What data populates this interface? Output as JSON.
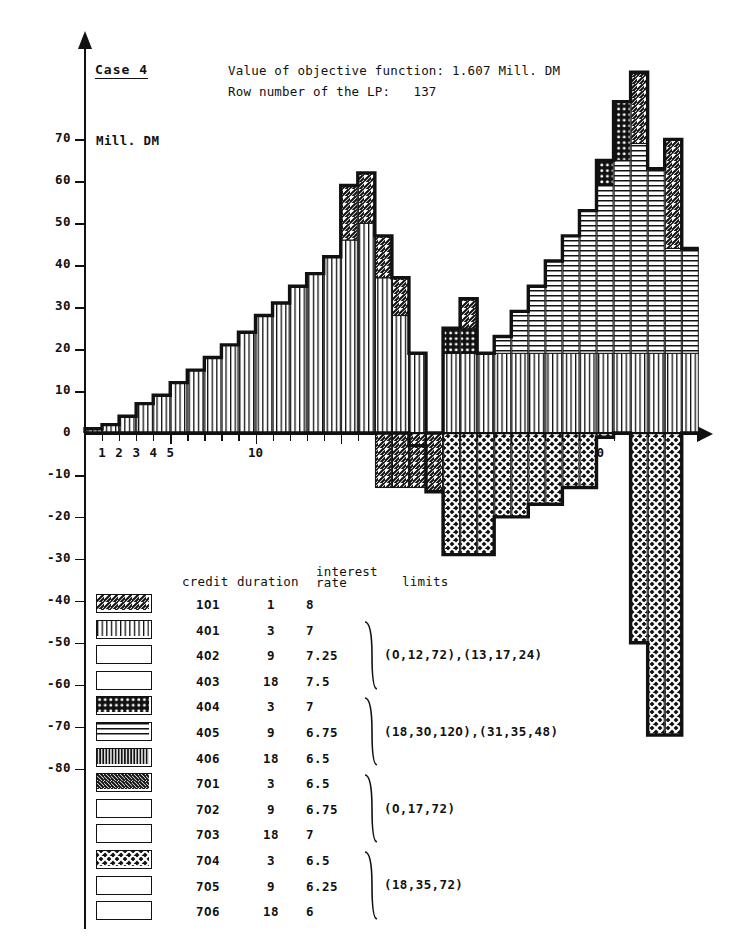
{
  "header": {
    "case_label": "Case 4",
    "objective_line": "Value of objective function: 1.607 Mill. DM",
    "row_line": "Row number of the LP:   137"
  },
  "axes": {
    "y_unit_label": "Mill. DM",
    "y_ticks": [
      "70",
      "60",
      "50",
      "40",
      "30",
      "20",
      "10",
      "0",
      "-10",
      "-20",
      "-30",
      "-40",
      "-50",
      "-60",
      "-70",
      "-80"
    ],
    "y_values": [
      70,
      60,
      50,
      40,
      30,
      20,
      10,
      0,
      -10,
      -20,
      -30,
      -40,
      -50,
      -60,
      -70,
      -80
    ],
    "x_ticks": [
      "1",
      "2",
      "3",
      "4",
      "5",
      "10",
      "30"
    ],
    "x_values": [
      1,
      2,
      3,
      4,
      5,
      10,
      30
    ],
    "x_min": 0,
    "x_max": 36,
    "y_min": -85,
    "y_max": 74
  },
  "legend": {
    "headers": {
      "credit": "credit",
      "duration": "duration",
      "interest_rate": "interest\nrate",
      "interest_rate_l1": "interest",
      "interest_rate_l2": "rate",
      "limits": "limits"
    },
    "rows": [
      {
        "credit": "1O1",
        "duration": "1",
        "rate": "8",
        "pattern": "diagonal-up"
      },
      {
        "credit": "4O1",
        "duration": "3",
        "rate": "7",
        "pattern": "vertical"
      },
      {
        "credit": "4O2",
        "duration": "9",
        "rate": "7.25",
        "pattern": "empty"
      },
      {
        "credit": "4O3",
        "duration": "18",
        "rate": "7.5",
        "pattern": "empty"
      },
      {
        "credit": "4O4",
        "duration": "3",
        "rate": "7",
        "pattern": "dotted-dark"
      },
      {
        "credit": "4O5",
        "duration": "9",
        "rate": "6.75",
        "pattern": "horizontal"
      },
      {
        "credit": "4O6",
        "duration": "18",
        "rate": "6.5",
        "pattern": "vertical-dark"
      },
      {
        "credit": "7O1",
        "duration": "3",
        "rate": "6.5",
        "pattern": "diagonal-down"
      },
      {
        "credit": "7O2",
        "duration": "9",
        "rate": "6.75",
        "pattern": "empty"
      },
      {
        "credit": "7O3",
        "duration": "18",
        "rate": "7",
        "pattern": "empty"
      },
      {
        "credit": "7O4",
        "duration": "3",
        "rate": "6.5",
        "pattern": "crosshatch-dark"
      },
      {
        "credit": "7O5",
        "duration": "9",
        "rate": "6.25",
        "pattern": "empty"
      },
      {
        "credit": "7O6",
        "duration": "18",
        "rate": "6",
        "pattern": "empty"
      }
    ],
    "limit_groups": [
      {
        "text": "(O,12,72),(13,17,24)",
        "from_row": 1,
        "to_row": 3
      },
      {
        "text": "(18,3O,12O),(31,35,48)",
        "from_row": 4,
        "to_row": 6
      },
      {
        "text": "(O,17,72)",
        "from_row": 7,
        "to_row": 9
      },
      {
        "text": "(18,35,72)",
        "from_row": 10,
        "to_row": 12
      }
    ]
  },
  "chart_data": {
    "type": "bar",
    "xlabel": "",
    "ylabel": "Mill. DM",
    "xlim": [
      0,
      36
    ],
    "ylim": [
      -85,
      74
    ],
    "grid": false,
    "legend_position": "below-left",
    "stacked": true,
    "x": [
      1,
      2,
      3,
      4,
      5,
      6,
      7,
      8,
      9,
      10,
      11,
      12,
      13,
      14,
      15,
      16,
      17,
      18,
      19,
      20,
      21,
      22,
      23,
      24,
      25,
      26,
      27,
      28,
      29,
      30,
      31,
      32,
      33,
      34,
      35,
      36
    ],
    "series": [
      {
        "name": "4O1 (vertical)",
        "pattern": "vertical",
        "values": [
          1,
          2,
          4,
          7,
          9,
          12,
          15,
          18,
          21,
          24,
          28,
          31,
          35,
          38,
          42,
          46,
          50,
          37,
          28,
          19,
          0,
          19,
          19,
          19,
          19,
          19,
          19,
          19,
          19,
          19,
          19,
          19,
          19,
          19,
          19,
          19
        ]
      },
      {
        "name": "4O5 (horizontal)",
        "pattern": "horizontal",
        "values": [
          0,
          0,
          0,
          0,
          0,
          0,
          0,
          0,
          0,
          0,
          0,
          0,
          0,
          0,
          0,
          0,
          0,
          0,
          0,
          0,
          0,
          0,
          0,
          0,
          4,
          10,
          16,
          22,
          28,
          34,
          40,
          46,
          50,
          44,
          25,
          25
        ]
      },
      {
        "name": "1O1 (diagonal-up)",
        "pattern": "diagonal-up",
        "values": [
          0,
          0,
          0,
          0,
          0,
          0,
          0,
          0,
          0,
          0,
          0,
          0,
          0,
          0,
          0,
          13,
          12,
          10,
          9,
          0,
          0,
          0,
          7,
          0,
          0,
          0,
          0,
          0,
          0,
          0,
          0,
          0,
          17,
          0,
          26,
          0
        ]
      },
      {
        "name": "4O4 (dotted-dark)",
        "pattern": "dotted-dark",
        "values": [
          0,
          0,
          0,
          0,
          0,
          0,
          0,
          0,
          0,
          0,
          0,
          0,
          0,
          0,
          0,
          0,
          0,
          0,
          0,
          0,
          0,
          6,
          6,
          0,
          0,
          0,
          0,
          0,
          0,
          0,
          6,
          14,
          0,
          0,
          0,
          0
        ]
      },
      {
        "name": "1O1 negative (diagonal-up)",
        "pattern": "diagonal-up",
        "values": [
          0,
          0,
          0,
          0,
          0,
          0,
          0,
          0,
          0,
          0,
          0,
          0,
          0,
          0,
          0,
          0,
          0,
          -13,
          -13,
          -13,
          -14,
          0,
          0,
          0,
          0,
          0,
          0,
          0,
          0,
          0,
          0,
          0,
          0,
          0,
          0,
          0
        ]
      },
      {
        "name": "7O4 (crosshatch-dark)",
        "pattern": "crosshatch-dark",
        "values": [
          0,
          0,
          0,
          0,
          0,
          0,
          0,
          0,
          0,
          0,
          0,
          0,
          0,
          0,
          0,
          0,
          0,
          0,
          0,
          -3,
          -14,
          -29,
          -29,
          -29,
          -20,
          -20,
          -17,
          -17,
          -13,
          -13,
          -1,
          0,
          -50,
          -72,
          -72,
          0
        ]
      }
    ],
    "notes": [
      "Thick outline traces the cumulative portfolio envelope.",
      "Left hump peaks near 51 Mill. DM at x=17.",
      "Right plateau peaks near 70 Mill. DM at x=32."
    ]
  }
}
